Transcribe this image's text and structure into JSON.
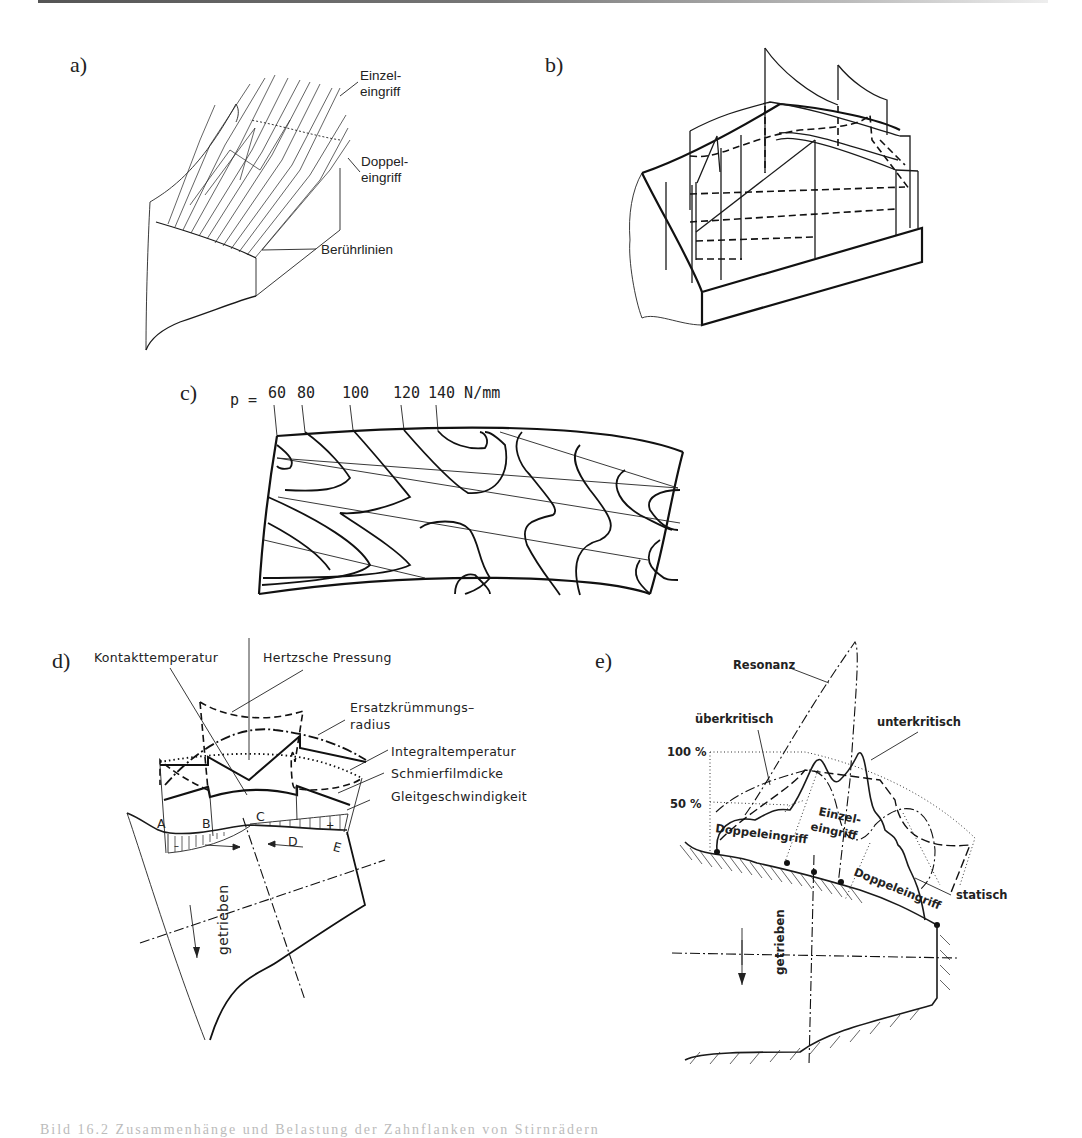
{
  "figure": {
    "panels": [
      {
        "id": "a",
        "label": "a)",
        "annotations": [
          "Einzel-",
          "eingriff",
          "Doppel-",
          "eingriff",
          "Berührlinien"
        ]
      },
      {
        "id": "b",
        "label": "b)",
        "annotations": []
      },
      {
        "id": "c",
        "label": "c)",
        "pressure_prefix": "p =",
        "pressure_values": [
          "60",
          "80",
          "100",
          "120",
          "140 N/mm"
        ]
      },
      {
        "id": "d",
        "label": "d)",
        "annotations": {
          "kontakttemperatur": "Kontakttemperatur",
          "hertzsche": "Hertzsche Pressung",
          "ersatz1": "Ersatzkrümmungs–",
          "ersatz2": "radius",
          "integral": "Integraltemperatur",
          "schmier": "Schmierfilmdicke",
          "gleit": "Gleitgeschwindigkeit",
          "driven": "getrieben"
        },
        "points": [
          "A",
          "B",
          "C",
          "D",
          "E"
        ],
        "signs": [
          "–",
          "+"
        ]
      },
      {
        "id": "e",
        "label": "e)",
        "annotations": {
          "resonanz": "Resonanz",
          "ueberkritisch": "überkritisch",
          "unterkritisch": "unterkritisch",
          "p100": "100 %",
          "p50": "50 %",
          "einzel1": "Einzel-",
          "einzel2": "eingriff",
          "doppel_left": "Doppeleingriff",
          "doppel_right": "Doppeleingriff",
          "statisch": "statisch",
          "driven": "getrieben"
        }
      }
    ],
    "caption": "Bild 16.2 Zusammenhänge und Belastung der Zahnflanken von Stirnrädern"
  }
}
